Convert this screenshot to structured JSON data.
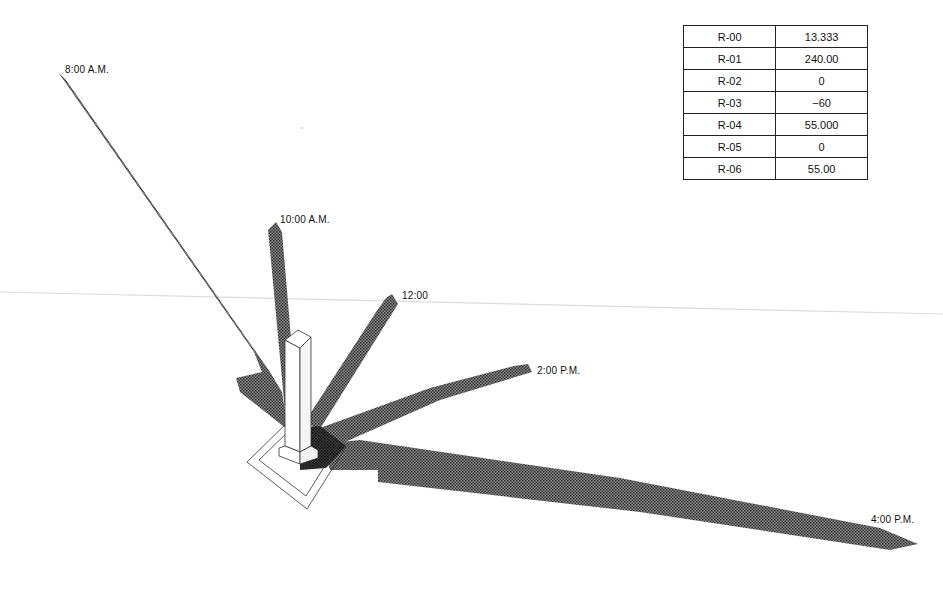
{
  "diagram": {
    "shadow_labels": [
      {
        "id": "0800",
        "text": "8:00 A.M."
      },
      {
        "id": "1000",
        "text": "10:00 A.M."
      },
      {
        "id": "1200",
        "text": "12:00"
      },
      {
        "id": "1400",
        "text": "2:00 P.M."
      },
      {
        "id": "1600",
        "text": "4:00 P.M."
      }
    ],
    "colors": {
      "shadow": "#4a4a4a",
      "shadow_dark": "#1a1a1a",
      "outline": "#333333",
      "horizon_line": "#d8d8d8"
    }
  },
  "parameters": {
    "rows": [
      {
        "key": "R-00",
        "value": "13.333"
      },
      {
        "key": "R-01",
        "value": "240.00"
      },
      {
        "key": "R-02",
        "value": "0"
      },
      {
        "key": "R-03",
        "value": "−60"
      },
      {
        "key": "R-04",
        "value": "55.000"
      },
      {
        "key": "R-05",
        "value": "0"
      },
      {
        "key": "R-06",
        "value": "55.00"
      }
    ]
  }
}
